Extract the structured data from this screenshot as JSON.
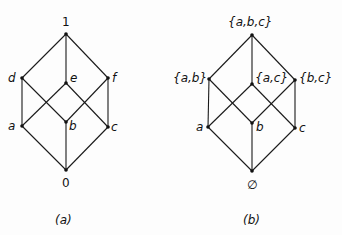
{
  "diagrams": [
    {
      "id": "a",
      "caption": "(a)",
      "nodes": [
        {
          "key": "top",
          "label": "1",
          "x": 66,
          "y": 34
        },
        {
          "key": "d",
          "label": "d",
          "x": 22,
          "y": 78
        },
        {
          "key": "e",
          "label": "e",
          "x": 66,
          "y": 83
        },
        {
          "key": "f",
          "label": "f",
          "x": 108,
          "y": 78
        },
        {
          "key": "a",
          "label": "a",
          "x": 22,
          "y": 126
        },
        {
          "key": "b",
          "label": "b",
          "x": 66,
          "y": 122
        },
        {
          "key": "c",
          "label": "c",
          "x": 108,
          "y": 127
        },
        {
          "key": "bottom",
          "label": "0",
          "x": 66,
          "y": 170
        }
      ],
      "edges": [
        [
          "top",
          "d"
        ],
        [
          "top",
          "e"
        ],
        [
          "top",
          "f"
        ],
        [
          "d",
          "a"
        ],
        [
          "d",
          "b"
        ],
        [
          "e",
          "a"
        ],
        [
          "e",
          "c"
        ],
        [
          "f",
          "b"
        ],
        [
          "f",
          "c"
        ],
        [
          "a",
          "bottom"
        ],
        [
          "b",
          "bottom"
        ],
        [
          "c",
          "bottom"
        ]
      ]
    },
    {
      "id": "b",
      "caption": "(b)",
      "nodes": [
        {
          "key": "top",
          "label": "{a,b,c}",
          "x": 252,
          "y": 35
        },
        {
          "key": "ab",
          "label": "{a,b}",
          "x": 209,
          "y": 79
        },
        {
          "key": "ac",
          "label": "{a,c}",
          "x": 252,
          "y": 84
        },
        {
          "key": "bc",
          "label": "{b,c}",
          "x": 295,
          "y": 80
        },
        {
          "key": "a",
          "label": "a",
          "x": 208,
          "y": 127
        },
        {
          "key": "b",
          "label": "b",
          "x": 252,
          "y": 123
        },
        {
          "key": "c",
          "label": "c",
          "x": 295,
          "y": 128
        },
        {
          "key": "bottom",
          "label": "∅",
          "x": 252,
          "y": 171
        }
      ],
      "edges": [
        [
          "top",
          "ab"
        ],
        [
          "top",
          "ac"
        ],
        [
          "top",
          "bc"
        ],
        [
          "ab",
          "a"
        ],
        [
          "ab",
          "b"
        ],
        [
          "ac",
          "a"
        ],
        [
          "ac",
          "c"
        ],
        [
          "bc",
          "b"
        ],
        [
          "bc",
          "c"
        ],
        [
          "a",
          "bottom"
        ],
        [
          "b",
          "bottom"
        ],
        [
          "c",
          "bottom"
        ]
      ]
    }
  ],
  "labels": {
    "a": {
      "one": "1",
      "d": "d",
      "e": "e",
      "f": "f",
      "a": "a",
      "b": "b",
      "c": "c",
      "zero": "0",
      "caption": "(a)"
    },
    "b": {
      "abc": "{a,b,c}",
      "ab": "{a,b}",
      "ac": "{a,c}",
      "bc": "{b,c}",
      "a": "a",
      "b": "b",
      "c": "c",
      "empty": "∅",
      "caption": "(b)"
    }
  }
}
